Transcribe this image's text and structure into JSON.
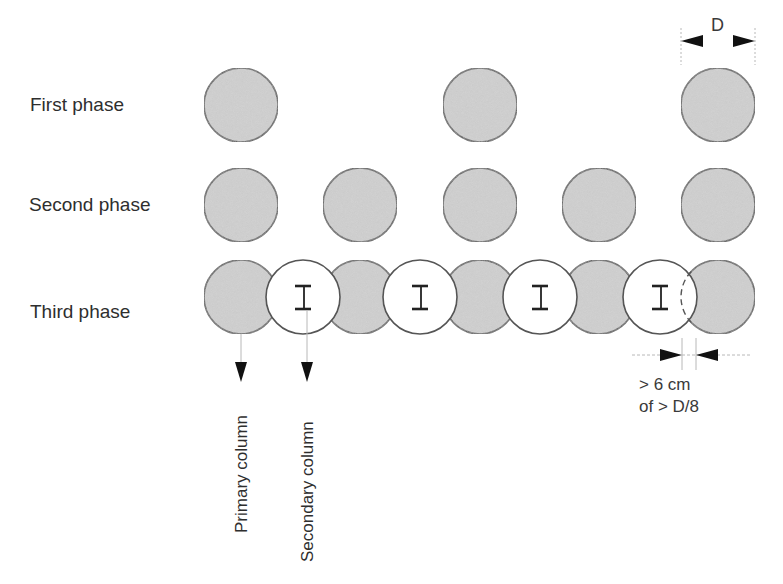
{
  "phases": [
    {
      "label": "First phase",
      "y": 105,
      "primary_x": [
        241,
        480,
        718
      ]
    },
    {
      "label": "Second phase",
      "y": 205,
      "primary_x": [
        241,
        360,
        480,
        599,
        718
      ]
    },
    {
      "label": "Third phase",
      "y": 297,
      "primary_x": [
        241,
        360,
        480,
        599,
        718
      ],
      "secondary_x": [
        303,
        420,
        540,
        660
      ]
    }
  ],
  "circle_radius": 37,
  "colors": {
    "primary_fill": "#c9c9c9",
    "secondary_fill": "#ffffff",
    "stroke": "#555555",
    "dim_line": "#b8b8b8",
    "arrow": "#111111"
  },
  "dimension_top": {
    "label": "D"
  },
  "dimension_overlap": {
    "line1": "> 6  cm",
    "line2": "of > D/8"
  },
  "column_labels": {
    "primary": "Primary column",
    "secondary": "Secondary column"
  },
  "secondary_marker": "I"
}
